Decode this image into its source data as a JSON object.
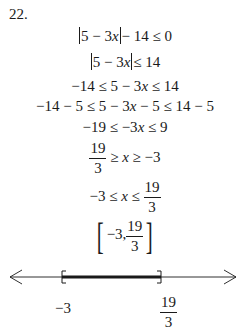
{
  "problem_number": "22.",
  "steps": {
    "s1": {
      "a": "5 − 3",
      "x": "x",
      "b": "− 14 ≤ 0"
    },
    "s2": {
      "a": "5 − 3",
      "x": "x",
      "b": "≤ 14"
    },
    "s3": {
      "a": "−14 ≤ 5 − 3",
      "x": "x",
      "b": " ≤ 14"
    },
    "s4": {
      "a": "−14 − 5 ≤ 5 − 3",
      "x": "x",
      "b": " − 5 ≤ 14 − 5"
    },
    "s5": {
      "a": "−19 ≤ −3",
      "x": "x",
      "b": " ≤ 9"
    },
    "s6": {
      "num": "19",
      "den": "3",
      "rest_a": " ≥ ",
      "x": "x",
      "rest_b": " ≥ −3"
    },
    "s7": {
      "lead": "−3 ≤ ",
      "x": "x",
      "mid": " ≤ ",
      "num": "19",
      "den": "3"
    },
    "s8": {
      "open": "[",
      "lead": "−3,",
      "num": "19",
      "den": "3",
      "close": "]"
    }
  },
  "number_line": {
    "left_label": "−3",
    "right_num": "19",
    "right_den": "3",
    "left_bracket": "[",
    "right_bracket": "]",
    "color": "#1a1a1a"
  }
}
